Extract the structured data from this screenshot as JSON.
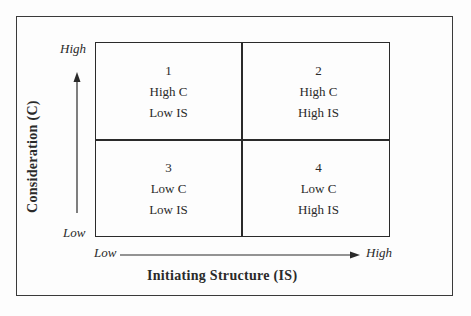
{
  "diagram": {
    "y_axis": {
      "label": "Consideration (C)",
      "high": "High",
      "low": "Low"
    },
    "x_axis": {
      "label": "Initiating Structure (IS)",
      "low": "Low",
      "high": "High"
    },
    "quadrants": [
      {
        "number": "1",
        "line1": "High C",
        "line2": "Low IS"
      },
      {
        "number": "2",
        "line1": "High C",
        "line2": "High IS"
      },
      {
        "number": "3",
        "line1": "Low C",
        "line2": "Low IS"
      },
      {
        "number": "4",
        "line1": "Low C",
        "line2": "High IS"
      }
    ]
  }
}
